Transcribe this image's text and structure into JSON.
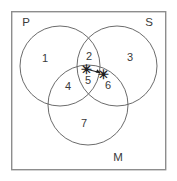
{
  "diagram": {
    "type": "venn",
    "universe": {
      "name": "universe-rectangle",
      "x": 11,
      "y": 11,
      "width": 155,
      "height": 159,
      "stroke": "#8d8d8d"
    },
    "stroke_color": "#5a5a5a",
    "text_color": "#3a3a3a",
    "background": "#ffffff",
    "sets": [
      {
        "id": "P",
        "label": "P",
        "label_x": 26,
        "label_y": 23,
        "cx": 60,
        "cy": 66,
        "r": 40
      },
      {
        "id": "S",
        "label": "S",
        "label_x": 149,
        "label_y": 23,
        "cx": 117,
        "cy": 66,
        "r": 40
      },
      {
        "id": "M",
        "label": "M",
        "label_x": 118,
        "label_y": 158,
        "cx": 88,
        "cy": 105,
        "r": 40
      }
    ],
    "regions": [
      {
        "id": "r1",
        "label": "1",
        "belongs": "P only",
        "x": 45,
        "y": 59
      },
      {
        "id": "r2",
        "label": "2",
        "belongs": "P and S",
        "x": 89,
        "y": 57
      },
      {
        "id": "r3",
        "label": "3",
        "belongs": "S only",
        "x": 130,
        "y": 58
      },
      {
        "id": "r4",
        "label": "4",
        "belongs": "P and M",
        "x": 68,
        "y": 87
      },
      {
        "id": "r5",
        "label": "5",
        "belongs": "P, S and M",
        "x": 88,
        "y": 81
      },
      {
        "id": "r6",
        "label": "6",
        "belongs": "S and M",
        "x": 108,
        "y": 86
      },
      {
        "id": "r7",
        "label": "7",
        "belongs": "M only",
        "x": 84,
        "y": 124
      }
    ],
    "marks": [
      {
        "id": "star-center",
        "glyph": "✳",
        "x": 86,
        "y": 71,
        "note": "asterisk in region 5 (P∩S∩M)"
      },
      {
        "id": "star-right",
        "glyph": "✳",
        "x": 103,
        "y": 76,
        "note": "asterisk in region 6 (S∩M)"
      }
    ],
    "arrow": {
      "id": "star-transfer-arrow",
      "from_x": 88,
      "from_y": 70,
      "to_x": 100,
      "to_y": 73,
      "note": "arrow from center asterisk to right asterisk"
    }
  }
}
